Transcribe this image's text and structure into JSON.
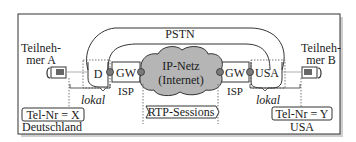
{
  "diagram": {
    "pstn_label": "PSTN",
    "internet": {
      "line1": "IP-Netz",
      "line2": "(Internet)"
    },
    "participant_a": {
      "line1": "Teilneh-",
      "line2": "mer A",
      "phone_number": "Tel-Nr = X",
      "country": "Deutschland",
      "exchange": "D"
    },
    "participant_b": {
      "line1": "Teilneh-",
      "line2": "mer B",
      "phone_number": "Tel-Nr = Y",
      "country": "USA",
      "exchange": "USA"
    },
    "gateway_left": {
      "label": "GW",
      "provider": "ISP"
    },
    "gateway_right": {
      "label": "GW",
      "provider": "ISP"
    },
    "local_left": "lokal",
    "local_right": "lokal",
    "rtp_sessions": "RTP-Sessions",
    "colors": {
      "cloud_fill": "#b5b5b5",
      "node_fill": "#7a7a7a",
      "line": "#333333",
      "frame_shadow": "#c8c8c8"
    }
  }
}
